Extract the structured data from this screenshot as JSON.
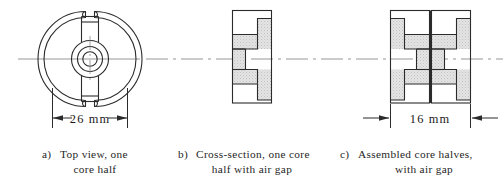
{
  "figure": {
    "background_color": "#ffffff",
    "line_color": "#2b2b2b",
    "hatch_color": "#d9d9d9",
    "centerline_color": "#8c8c8c"
  },
  "panels": [
    {
      "id": "a",
      "label_prefix": "a)",
      "caption_line1": "Top  view,  one",
      "caption_line2": "core half",
      "view_type": "top-view",
      "dimension": {
        "value": "26 mm",
        "measures": "outer diameter",
        "arrow_style": "inward"
      }
    },
    {
      "id": "b",
      "label_prefix": "b)",
      "caption_line1": "Cross-section,  one  core",
      "caption_line2": "half  with  air  gap",
      "view_type": "cross-section",
      "dimension": null
    },
    {
      "id": "c",
      "label_prefix": "c)",
      "caption_line1": "Assembled  core  halves,",
      "caption_line2": "with  air  gap",
      "view_type": "assembled-cross-section",
      "dimension": {
        "value": "16 mm",
        "measures": "assembled height",
        "arrow_style": "outward"
      }
    }
  ],
  "centerline": {
    "style": "dash-dot",
    "orientation": "horizontal"
  }
}
